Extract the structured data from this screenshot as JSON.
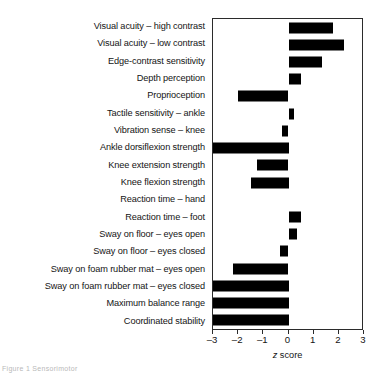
{
  "chart_data": {
    "type": "bar",
    "orientation": "horizontal",
    "title": "",
    "xlabel": "z score",
    "ylabel": "",
    "xlim": [
      -3,
      3
    ],
    "xticks": [
      -3,
      -2,
      -1,
      0,
      1,
      2,
      3
    ],
    "xtick_labels": [
      "-3",
      "-2",
      "-1",
      "0",
      "1",
      "2",
      "3"
    ],
    "grid": false,
    "legend": false,
    "bar_color": "#000000",
    "categories": [
      "Visual acuity – high contrast",
      "Visual acuity – low contrast",
      "Edge-contrast sensitivity",
      "Depth perception",
      "Proprioception",
      "Tactile sensitivity – ankle",
      "Vibration sense – knee",
      "Ankle dorsiflexion strength",
      "Knee extension strength",
      "Knee flexion strength",
      "Reaction time – hand",
      "Reaction time – foot",
      "Sway on floor – eyes open",
      "Sway on floor – eyes closed",
      "Sway on foam rubber mat – eyes open",
      "Sway on foam rubber mat – eyes closed",
      "Maximum balance range",
      "Coordinated stability"
    ],
    "values": [
      1.75,
      2.2,
      1.35,
      0.5,
      -2.0,
      0.2,
      -0.25,
      -3.0,
      -1.25,
      -1.5,
      0.0,
      0.5,
      0.35,
      -0.35,
      -2.2,
      -3.0,
      -3.0,
      -3.0
    ]
  },
  "axis": {
    "title_italic": "z",
    "title_rest": " score"
  },
  "caption_fragment": "Figure 1  Sensorimotor"
}
